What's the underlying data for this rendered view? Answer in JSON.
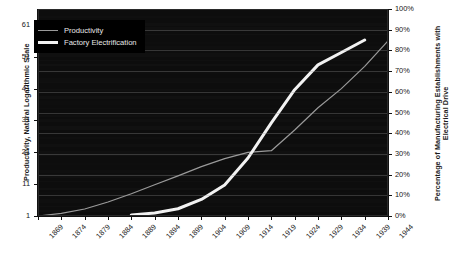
{
  "chart_data": {
    "type": "line",
    "title": "",
    "xlabel": "",
    "ylabel": "Productivity, Natural Logarithmic Scale",
    "y2label": "Percentage of Manufacturing Establishments with Electrical Drive",
    "grid": true,
    "legend_position": "top-left",
    "background": "#0d0d0d",
    "x": [
      1869,
      1874,
      1879,
      1884,
      1889,
      1894,
      1899,
      1904,
      1909,
      1914,
      1919,
      1924,
      1929,
      1934,
      1939,
      1944
    ],
    "xtick_labels": [
      "1869",
      "1874",
      "1879",
      "1884",
      "1889",
      "1894",
      "1899",
      "1904",
      "1909",
      "1914",
      "1919",
      "1924",
      "1929",
      "1934",
      "1939",
      "1944"
    ],
    "xlim": [
      1869,
      1944
    ],
    "ylim": [
      1,
      66
    ],
    "ytick_labels": [
      "1",
      "11",
      "21",
      "31",
      "41",
      "51",
      "61"
    ],
    "ytick_values": [
      1,
      11,
      21,
      31,
      41,
      51,
      61
    ],
    "y2lim": [
      0,
      100
    ],
    "y2tick_labels": [
      "0%",
      "10%",
      "20%",
      "30%",
      "40%",
      "50%",
      "60%",
      "70%",
      "80%",
      "90%",
      "100%"
    ],
    "y2tick_values": [
      0,
      10,
      20,
      30,
      40,
      50,
      60,
      70,
      80,
      90,
      100
    ],
    "series": [
      {
        "name": "Productivity",
        "axis": "left",
        "color": "#9a9a9a",
        "width": 1.2,
        "x": [
          1869,
          1874,
          1879,
          1884,
          1889,
          1894,
          1899,
          1904,
          1909,
          1914,
          1919,
          1924,
          1929,
          1934,
          1939,
          1944
        ],
        "values": [
          1.0,
          1.8,
          3.2,
          5.4,
          8.0,
          10.8,
          13.6,
          16.5,
          19.0,
          21.0,
          21.5,
          28.0,
          35.0,
          41.0,
          48.0,
          56.0
        ]
      },
      {
        "name": "Factory Electrification",
        "axis": "right",
        "color": "#f2f2f2",
        "width": 3.0,
        "x": [
          1889,
          1894,
          1899,
          1904,
          1909,
          1914,
          1919,
          1924,
          1929,
          1934,
          1939
        ],
        "values": [
          0.5,
          1.5,
          3.5,
          8.0,
          15.0,
          28.0,
          45.0,
          61.0,
          73.0,
          79.0,
          85.0
        ]
      }
    ]
  },
  "legend": {
    "items": [
      {
        "label": "Productivity",
        "style": "thin"
      },
      {
        "label": "Factory Electrification",
        "style": "thick"
      }
    ]
  },
  "axes": {
    "left_title": "Productivity, Natural Logarithmic Scale",
    "right_title": "Percentage of Manufacturing Establishments with Electrical Drive"
  }
}
